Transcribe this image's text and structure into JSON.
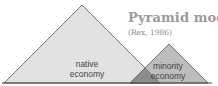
{
  "title": "Pyramid model",
  "subtitle": "(Rex, 1986)",
  "pyramids": [
    {
      "id": "native",
      "label_line1": "native",
      "label_line2": "economy",
      "fill": "#e2e2e2"
    },
    {
      "id": "minority",
      "label_line1": "minority",
      "label_line2": "economy",
      "fill": "#bdbdbd"
    }
  ],
  "overlap_fill": "#8c8c8c",
  "stroke": "#555555"
}
